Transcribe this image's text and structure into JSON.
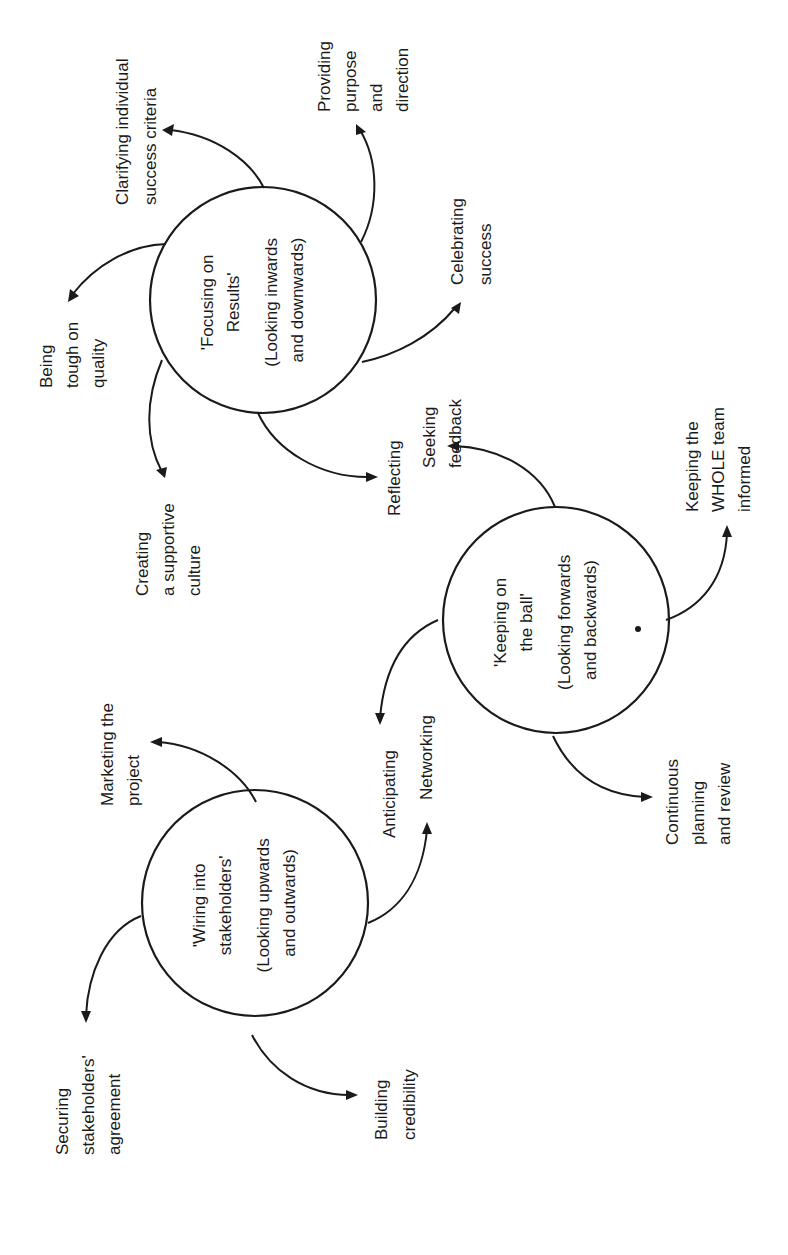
{
  "diagram": {
    "orientation": "rotated 90 degrees counter-clockwise",
    "hubs": [
      {
        "id": "focusing",
        "title_lines": [
          "'Focusing on",
          "Results'"
        ],
        "subtitle_lines": [
          "(Looking inwards",
          "and downwards)"
        ],
        "spokes": [
          {
            "lines": [
              "Clarifying individual",
              "success criteria"
            ]
          },
          {
            "lines": [
              "Providing",
              "purpose",
              "and",
              "direction"
            ]
          },
          {
            "lines": [
              "Being",
              "tough on",
              "quality"
            ]
          },
          {
            "lines": [
              "Creating",
              "a supportive",
              "culture"
            ]
          },
          {
            "lines": [
              "Reflecting"
            ]
          },
          {
            "lines": [
              "Celebrating",
              "success"
            ]
          }
        ]
      },
      {
        "id": "keeping",
        "title_lines": [
          "'Keeping on",
          "the ball'"
        ],
        "subtitle_lines": [
          "(Looking forwards",
          "and backwards)"
        ],
        "spokes": [
          {
            "lines": [
              "Seeking",
              "feedback"
            ]
          },
          {
            "lines": [
              "Anticipating"
            ]
          },
          {
            "lines": [
              "Keeping the",
              "WHOLE team",
              "informed"
            ]
          },
          {
            "lines": [
              "Continuous",
              "planning",
              "and review"
            ]
          }
        ]
      },
      {
        "id": "wiring",
        "title_lines": [
          "'Wiring into",
          "stakeholders'"
        ],
        "subtitle_lines": [
          "(Looking upwards",
          "and outwards)"
        ],
        "spokes": [
          {
            "lines": [
              "Marketing the",
              "project"
            ]
          },
          {
            "lines": [
              "Networking"
            ]
          },
          {
            "lines": [
              "Securing",
              "stakeholders'",
              "agreement"
            ]
          },
          {
            "lines": [
              "Building",
              "credibility"
            ]
          }
        ]
      }
    ]
  },
  "colors": {
    "ink": "#1a1a1a",
    "paper": "#ffffff"
  }
}
